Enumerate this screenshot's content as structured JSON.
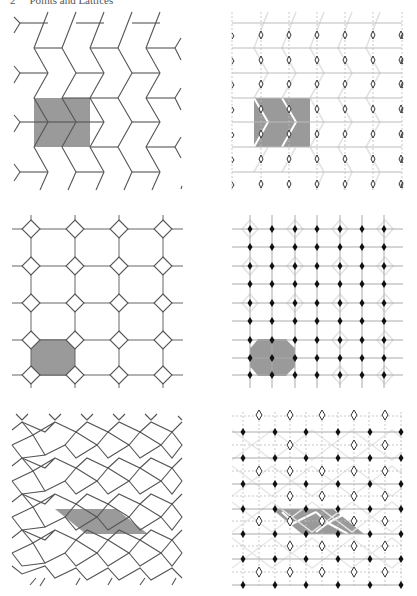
{
  "running_head": {
    "number": "2",
    "title": "Points and Lattices"
  },
  "colors": {
    "line": "#555555",
    "faint_line": "#cfcfcf",
    "shade": "#9a9a9a",
    "point_fill": "#111111",
    "background": "#ffffff"
  },
  "panels": [
    {
      "id": "chevron-tiling",
      "position": "top-left",
      "description": "Chevron (herringbone) tiling with shaded rectangular fundamental domain"
    },
    {
      "id": "chevron-lattice",
      "position": "top-right",
      "description": "Lattice of diamond points over faint chevron tiling with shaded fundamental domain"
    },
    {
      "id": "octagon-square-tiling",
      "position": "middle-left",
      "description": "Square grid with diamond (square) vertices, shaded octagonal tile"
    },
    {
      "id": "octagon-square-lattice",
      "position": "middle-right",
      "description": "Square lattice of black points over faint octagon tiling, shaded octagon"
    },
    {
      "id": "rhombus-tiling",
      "position": "bottom-left",
      "description": "Quadrilateral (rhombic) tiling with shaded parallelogram fundamental domain"
    },
    {
      "id": "rhombus-lattice",
      "position": "bottom-right",
      "description": "Lattice of alternating black and white diamond points over faint tiling, shaded parallelogram"
    }
  ]
}
